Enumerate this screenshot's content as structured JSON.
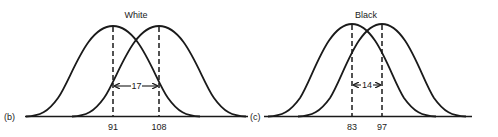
{
  "figure": {
    "panels": [
      {
        "id": "b",
        "panel_label": "(b)",
        "title": "White",
        "left_mean_label": "91",
        "right_mean_label": "108",
        "difference_label": "17",
        "left_mean": 91,
        "right_mean": 108,
        "difference": 17
      },
      {
        "id": "c",
        "panel_label": "(c)",
        "title": "Black",
        "left_mean_label": "83",
        "right_mean_label": "97",
        "difference_label": "14",
        "left_mean": 83,
        "right_mean": 97,
        "difference": 14
      }
    ],
    "colors": {
      "ink": "#1a1a1a",
      "background": "#ffffff"
    }
  }
}
